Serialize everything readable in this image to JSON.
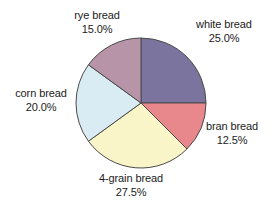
{
  "chart_data": {
    "type": "pie",
    "title": "",
    "subtitle": "",
    "xlabel": "",
    "ylabel": "",
    "legend": "none",
    "grid": false,
    "start_angle_deg": 0,
    "direction": "clockwise",
    "units": "percent",
    "total": 100.0,
    "categories": [
      "white bread",
      "bran bread",
      "4-grain bread",
      "corn bread",
      "rye bread"
    ],
    "values": [
      25.0,
      12.5,
      27.5,
      20.0,
      15.0
    ],
    "value_labels": [
      "25.0%",
      "12.5%",
      "27.5%",
      "20.0%",
      "15.0%"
    ],
    "colors": [
      "#7b749e",
      "#e8878c",
      "#faf5c8",
      "#daecf3",
      "#b794a8"
    ],
    "slices": [
      {
        "name": "white bread",
        "value": 25.0,
        "value_label": "25.0%",
        "color": "#7b749e",
        "start_deg": 0.0,
        "end_deg": 90.0
      },
      {
        "name": "bran bread",
        "value": 12.5,
        "value_label": "12.5%",
        "color": "#e8878c",
        "start_deg": 90.0,
        "end_deg": 135.0
      },
      {
        "name": "4-grain bread",
        "value": 27.5,
        "value_label": "27.5%",
        "color": "#faf5c8",
        "start_deg": 135.0,
        "end_deg": 234.0
      },
      {
        "name": "corn bread",
        "value": 20.0,
        "value_label": "20.0%",
        "color": "#daecf3",
        "start_deg": 234.0,
        "end_deg": 306.0
      },
      {
        "name": "rye bread",
        "value": 15.0,
        "value_label": "15.0%",
        "color": "#b794a8",
        "start_deg": 306.0,
        "end_deg": 360.0
      }
    ]
  },
  "style": {
    "background": "#ffffff",
    "slice_outline": "#4a4a4a",
    "text_color": "#1c1c1c"
  },
  "geometry": {
    "center_x": 141,
    "center_y": 103,
    "radius": 65
  }
}
